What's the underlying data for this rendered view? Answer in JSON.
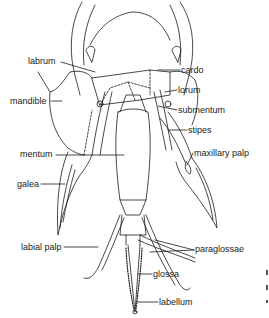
{
  "diagram": {
    "labels": {
      "labrum": "labrum",
      "mandible": "mandible",
      "mentum": "mentum",
      "galea": "galea",
      "labial_palp": "labial palp",
      "cardo": "cardo",
      "lorum": "lorum",
      "submentum": "submentum",
      "stipes": "stipes",
      "maxillary_palp": "maxillary palp",
      "paraglossae": "paraglossae",
      "glossa": "glossa",
      "labellum": "labellum"
    },
    "colors": {
      "line": "#1a1a1a",
      "background": "#ffffff"
    }
  }
}
